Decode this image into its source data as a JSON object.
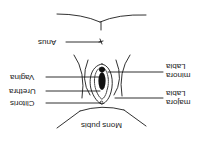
{
  "diagram": {
    "orientation": "rotated 180 degrees",
    "colors": {
      "line": "#1a1a1a",
      "background": "#ffffff",
      "fill": "#111111"
    },
    "labels": {
      "anus": "Anus",
      "vagina": "Vagina",
      "urethra": "Urethra",
      "clitoris": "Clitoris",
      "mons_pubis": "Mons pubis",
      "labia_minora_line1": "Labia",
      "labia_minora_line2": "minora",
      "labia_majora_line1": "Labia",
      "labia_majora_line2": "majora"
    }
  }
}
